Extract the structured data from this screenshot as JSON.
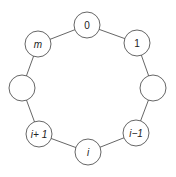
{
  "diagram": {
    "type": "cycle-graph",
    "node_radius": 13,
    "stroke_color": "#555555",
    "nodes": [
      {
        "id": "n0",
        "label": "0",
        "italic": false,
        "cx": 87,
        "cy": 25
      },
      {
        "id": "n1",
        "label": "1",
        "italic": false,
        "cx": 137,
        "cy": 43
      },
      {
        "id": "nR",
        "label": "",
        "italic": false,
        "cx": 153,
        "cy": 88
      },
      {
        "id": "nim1",
        "label": "i−1",
        "italic": true,
        "cx": 136,
        "cy": 133
      },
      {
        "id": "ni",
        "label": "i",
        "italic": true,
        "cx": 88,
        "cy": 152
      },
      {
        "id": "nip1",
        "label": "i+ 1",
        "italic": true,
        "cx": 39,
        "cy": 134
      },
      {
        "id": "nL",
        "label": "",
        "italic": false,
        "cx": 22,
        "cy": 88
      },
      {
        "id": "nm",
        "label": "m",
        "italic": true,
        "cx": 38,
        "cy": 44
      }
    ],
    "edges": [
      [
        "n0",
        "n1"
      ],
      [
        "n1",
        "nR"
      ],
      [
        "nR",
        "nim1"
      ],
      [
        "nim1",
        "ni"
      ],
      [
        "ni",
        "nip1"
      ],
      [
        "nip1",
        "nL"
      ],
      [
        "nL",
        "nm"
      ],
      [
        "nm",
        "n0"
      ]
    ]
  }
}
